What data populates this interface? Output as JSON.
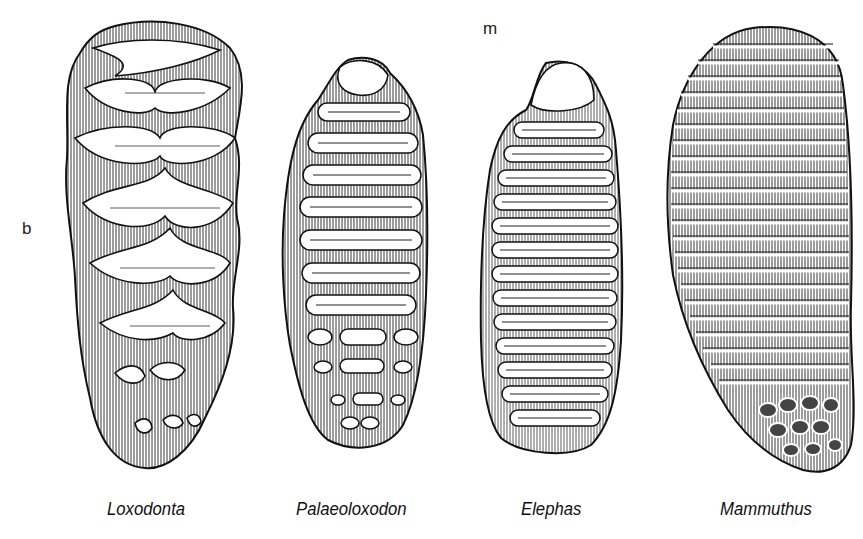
{
  "figure": {
    "panel_labels": {
      "b": "b",
      "m": "m"
    },
    "teeth": [
      {
        "genus": "Loxodonta",
        "plates": 7,
        "plate_style": "lozenge"
      },
      {
        "genus": "Palaeoloxodon",
        "plates": 9,
        "plate_style": "lamellar-with-median-expansion"
      },
      {
        "genus": "Elephas",
        "plates": 13,
        "plate_style": "folded-lamellar"
      },
      {
        "genus": "Mammuthus",
        "plates": 22,
        "plate_style": "thin-parallel-lamellar"
      }
    ]
  }
}
